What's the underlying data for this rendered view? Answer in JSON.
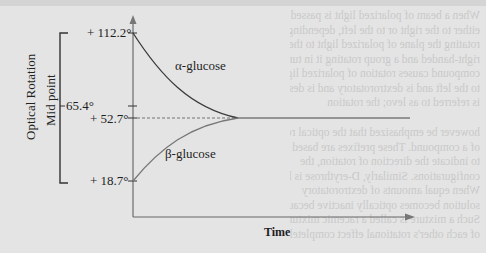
{
  "figure": {
    "y_axis": {
      "title": "Optical Rotation",
      "sub_title": "Mid point",
      "ticks": [
        "+ 112.2°",
        "+ 52.7°",
        "+ 18.7°"
      ],
      "midpoint_label": "65.4°"
    },
    "x_axis": {
      "title": "Time"
    },
    "curves": [
      {
        "name": "α-glucose",
        "start": 112.2,
        "end": 52.7
      },
      {
        "name": "β-glucose",
        "start": 18.7,
        "end": 52.7
      }
    ],
    "equilibrium_value": 52.7
  },
  "background_text": {
    "top_lines": [
      "When a beam of polarized light is passed through an",
      "either to the right or to the left, depending upon",
      "rotating the plane of polarized light to the right is",
      "right-handed and a group rotating it in turn",
      "compound causes rotation of polarized light to",
      "to the left and is dextrorotatory and is designated",
      "is referred to as levo; the rotation"
    ],
    "bottom_lines": [
      "however be emphasized that the optical rot",
      "of a compound. These prefixes are based",
      "to indicate the direction of rotation, the",
      "configurations. Similarly, D-erythrose is levo",
      "When equal amounts of dextrorotatory",
      "solution becomes optically inactive because",
      "Such a mixture is called a racemic mixture",
      "of each other's rotational effect completely"
    ]
  }
}
